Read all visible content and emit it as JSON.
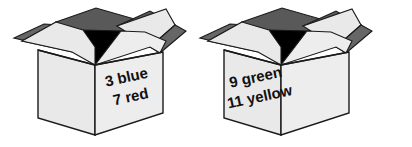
{
  "figure": {
    "background_color": "#ffffff",
    "line_color": "#1a1a1a"
  },
  "palette": {
    "face_light": "#e9e9e9",
    "face_light_alt": "#ededed",
    "flap_outer": "#e4e4e4",
    "flap_inner_dark": "#666666",
    "flap_inner_mid": "#595959",
    "void_black": "#000000",
    "text": "#111111"
  },
  "boxes": [
    {
      "id": "left-box",
      "name": "box-left",
      "label_lines": [
        "3 blue",
        "7 red"
      ],
      "items": [
        {
          "count": "3",
          "color": "blue"
        },
        {
          "count": "7",
          "color": "red"
        }
      ],
      "label_rotation_deg": "-12"
    },
    {
      "id": "right-box",
      "name": "box-right",
      "label_lines": [
        "9 green",
        "11 yellow"
      ],
      "items": [
        {
          "count": "9",
          "color": "green"
        },
        {
          "count": "11",
          "color": "yellow"
        }
      ],
      "label_rotation_deg": "-12"
    }
  ]
}
